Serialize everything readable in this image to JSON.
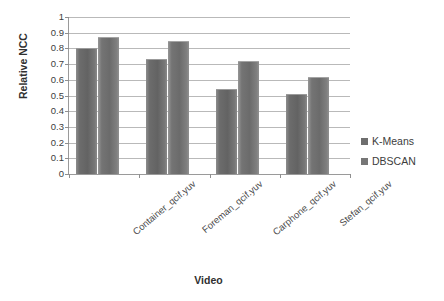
{
  "chart_data": {
    "type": "bar",
    "title": "",
    "xlabel": "Video",
    "ylabel": "Relative NCC",
    "categories": [
      "Container_qcif.yuv",
      "Foreman_qcif.yuv",
      "Carphone_qcif.yuv",
      "Stefan_qcif.yuv"
    ],
    "series": [
      {
        "name": "K-Means",
        "values": [
          0.8,
          0.73,
          0.54,
          0.51
        ],
        "color": "#6e6e6e"
      },
      {
        "name": "DBSCAN",
        "values": [
          0.875,
          0.85,
          0.72,
          0.62
        ],
        "color": "#767676"
      }
    ],
    "ylim": [
      0,
      1
    ],
    "ytick_step": 0.1,
    "ytick_labels": [
      "1",
      "0.9",
      "0.8",
      "0.7",
      "0.6",
      "0.5",
      "0.4",
      "0.3",
      "0.2",
      "0.1",
      "0"
    ],
    "ytick_values": [
      1,
      0.9,
      0.8,
      0.7,
      0.6,
      0.5,
      0.4,
      0.3,
      0.2,
      0.1,
      0
    ],
    "grid": true,
    "grid_axis": "y",
    "legend_position": "right",
    "xtick_rotation": -40
  },
  "legend": {
    "items": [
      {
        "label": "K-Means",
        "swatch": "#6e6e6e"
      },
      {
        "label": "DBSCAN",
        "swatch": "#767676"
      }
    ]
  },
  "axes": {
    "x_title": "Video",
    "y_title": "Relative NCC"
  }
}
